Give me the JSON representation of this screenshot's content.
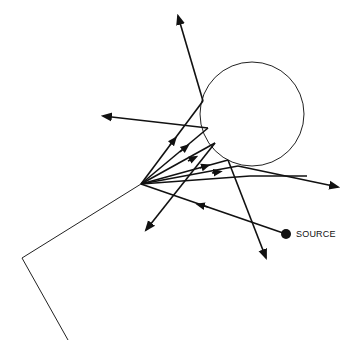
{
  "diagram": {
    "labels": {
      "source": "SOURCE"
    },
    "colors": {
      "stroke": "#111111",
      "background": "#ffffff"
    },
    "sphere": {
      "cx": 252,
      "cy": 114,
      "r": 52
    },
    "source_point": {
      "x": 286,
      "y": 234
    },
    "focus_point": {
      "x": 141,
      "y": 184
    }
  }
}
